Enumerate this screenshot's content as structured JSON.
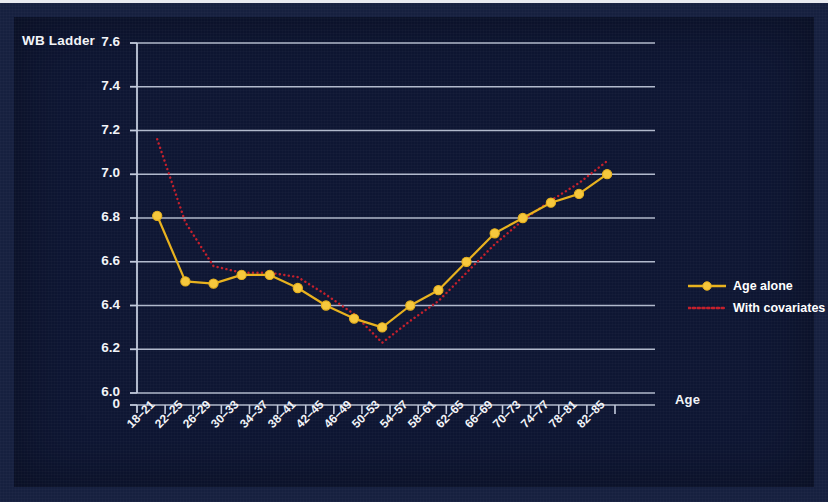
{
  "figure": {
    "background_color": "#0e1633",
    "frame_color": "#16203f"
  },
  "axes": {
    "y_title": "WB Ladder",
    "x_title": "Age",
    "y_ticks": [
      "7.6",
      "7.4",
      "7.2",
      "7.0",
      "6.8",
      "6.6",
      "6.4",
      "6.2",
      "6.0",
      "0"
    ],
    "x_ticks": [
      "18–21",
      "22–25",
      "26–29",
      "30–33",
      "34–37",
      "38–41",
      "42–45",
      "46–49",
      "50–53",
      "54–57",
      "58–61",
      "62–65",
      "66–69",
      "70–73",
      "74–77",
      "78–81",
      "82–85"
    ]
  },
  "legend": {
    "position": "right",
    "items": [
      {
        "label": "Age alone",
        "color": "#e8b21f",
        "style": "solid-marker"
      },
      {
        "label": "With covariates",
        "color": "#c5202c",
        "style": "dotted"
      }
    ]
  },
  "chart_data": {
    "type": "line",
    "title": "",
    "subtitle": "",
    "xlabel": "Age",
    "ylabel": "WB Ladder",
    "ylim": [
      6.0,
      7.6
    ],
    "ytick_values": [
      7.6,
      7.4,
      7.2,
      7.0,
      6.8,
      6.6,
      6.4,
      6.2,
      6.0
    ],
    "axis_break_label": "0",
    "grid": "horizontal",
    "legend_position": "right",
    "categories": [
      "18–21",
      "22–25",
      "26–29",
      "30–33",
      "34–37",
      "38–41",
      "42–45",
      "46–49",
      "50–53",
      "54–57",
      "58–61",
      "62–65",
      "66–69",
      "70–73",
      "74–77",
      "78–81",
      "82–85"
    ],
    "series": [
      {
        "name": "Age alone",
        "color": "#e8b21f",
        "marker": "circle",
        "line_style": "solid",
        "values": [
          6.81,
          6.51,
          6.5,
          6.54,
          6.54,
          6.48,
          6.4,
          6.34,
          6.3,
          6.4,
          6.47,
          6.6,
          6.73,
          6.8,
          6.87,
          6.91,
          7.0
        ]
      },
      {
        "name": "With covariates",
        "color": "#c5202c",
        "marker": "none",
        "line_style": "dotted",
        "values": [
          7.16,
          6.78,
          6.58,
          6.55,
          6.55,
          6.53,
          6.45,
          6.36,
          6.23,
          6.33,
          6.42,
          6.55,
          6.68,
          6.79,
          6.88,
          6.96,
          7.06
        ]
      }
    ]
  }
}
